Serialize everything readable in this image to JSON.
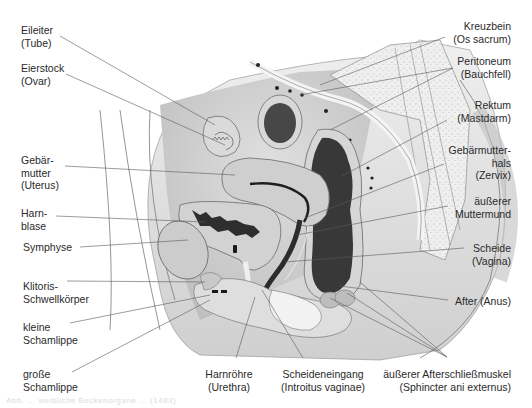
{
  "diagram": {
    "type": "anatomical-cross-section"
  },
  "labels": {
    "left": [
      {
        "id": "eileiter",
        "lines": [
          "Eileiter",
          "(Tube)"
        ]
      },
      {
        "id": "eierstock",
        "lines": [
          "Eierstock",
          "(Ovar)"
        ]
      },
      {
        "id": "gebaermutter",
        "lines": [
          "Gebär-",
          "mutter",
          "(Uterus)"
        ]
      },
      {
        "id": "harnblase",
        "lines": [
          "Harn-",
          "blase"
        ]
      },
      {
        "id": "symphyse",
        "lines": [
          "Symphyse"
        ]
      },
      {
        "id": "klitoris",
        "lines": [
          "Klitoris-",
          "Schwellkörper"
        ]
      },
      {
        "id": "kleine-schamlippe",
        "lines": [
          "kleine",
          "Schamlippe"
        ]
      },
      {
        "id": "grosse-schamlippe",
        "lines": [
          "große",
          "Schamlippe"
        ]
      }
    ],
    "right": [
      {
        "id": "kreuzbein",
        "lines": [
          "Kreuzbein",
          "(Os sacrum)"
        ]
      },
      {
        "id": "peritoneum",
        "lines": [
          "Peritoneum",
          "(Bauchfell)"
        ]
      },
      {
        "id": "rektum",
        "lines": [
          "Rektum",
          "(Mastdarm)"
        ]
      },
      {
        "id": "zervix",
        "lines": [
          "Gebärmutter-",
          "hals",
          "(Zervix)"
        ]
      },
      {
        "id": "muttermund",
        "lines": [
          "äußerer",
          "Muttermund"
        ]
      },
      {
        "id": "scheide",
        "lines": [
          "Scheide",
          "(Vagina)"
        ]
      },
      {
        "id": "after",
        "lines": [
          "After (Anus)"
        ]
      }
    ],
    "bottom": [
      {
        "id": "harnroehre",
        "lines": [
          "Harnröhre",
          "(Urethra)"
        ]
      },
      {
        "id": "scheideneingang",
        "lines": [
          "Scheideneingang",
          "(Introitus vaginae)"
        ]
      },
      {
        "id": "sphincter",
        "lines": [
          "äußerer Afterschließmuskel",
          "(Sphincter ani externus)"
        ]
      }
    ]
  },
  "caption": "Abb. … weibliche Beckenorgane … (1483)",
  "colors": {
    "background": "#ffffff",
    "text": "#2a2a2a",
    "leader_line": "#555555",
    "tissue_light": "#e6e6e6",
    "tissue_mid": "#c8c8c8",
    "tissue_dark": "#3a3a3a",
    "bone_dots": "#ededed"
  }
}
